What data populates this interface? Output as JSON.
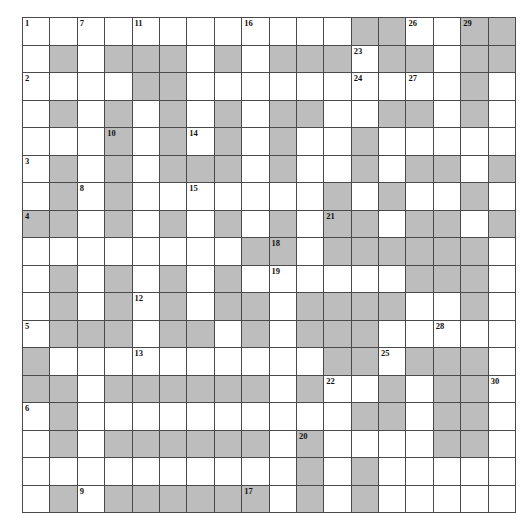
{
  "puzzle": {
    "title": "Crossword Grid",
    "columns": 18,
    "rows": 17,
    "cell_size_px": 26.4,
    "colors": {
      "background": "#ffffff",
      "open_cell": "#ffffff",
      "blocked_cell": "#bdbdbd",
      "grid_line": "#4a4a4a",
      "number_text": "#111111"
    },
    "clue_number_count": 30,
    "clue_numbers": [
      {
        "number": "1",
        "row": 1,
        "col": 1
      },
      {
        "number": "2",
        "row": 1,
        "col": 3
      },
      {
        "number": "3",
        "row": 1,
        "col": 6
      },
      {
        "number": "4",
        "row": 1,
        "col": 8
      },
      {
        "number": "5",
        "row": 1,
        "col": 12
      },
      {
        "number": "6",
        "row": 1,
        "col": 15
      },
      {
        "number": "7",
        "row": 3,
        "col": 1
      },
      {
        "number": "8",
        "row": 3,
        "col": 7
      },
      {
        "number": "9",
        "row": 3,
        "col": 18
      },
      {
        "number": "10",
        "row": 4,
        "col": 5
      },
      {
        "number": "11",
        "row": 5,
        "col": 1
      },
      {
        "number": "12",
        "row": 5,
        "col": 11
      },
      {
        "number": "13",
        "row": 5,
        "col": 13
      },
      {
        "number": "14",
        "row": 7,
        "col": 5
      },
      {
        "number": "15",
        "row": 7,
        "col": 7
      },
      {
        "number": "16",
        "row": 9,
        "col": 1
      },
      {
        "number": "17",
        "row": 9,
        "col": 18
      },
      {
        "number": "18",
        "row": 10,
        "col": 9
      },
      {
        "number": "19",
        "row": 10,
        "col": 10
      },
      {
        "number": "20",
        "row": 11,
        "col": 16
      },
      {
        "number": "21",
        "row": 12,
        "col": 8
      },
      {
        "number": "22",
        "row": 12,
        "col": 14
      },
      {
        "number": "23",
        "row": 13,
        "col": 2
      },
      {
        "number": "24",
        "row": 13,
        "col": 3
      },
      {
        "number": "25",
        "row": 14,
        "col": 13
      },
      {
        "number": "26",
        "row": 15,
        "col": 1
      },
      {
        "number": "27",
        "row": 15,
        "col": 3
      },
      {
        "number": "28",
        "row": 16,
        "col": 12
      },
      {
        "number": "29",
        "row": 17,
        "col": 1
      },
      {
        "number": "30",
        "row": 18,
        "col": 14
      }
    ],
    "grid": [
      [
        0,
        0,
        0,
        0,
        0,
        0,
        0,
        0,
        0,
        0,
        0,
        0,
        1,
        1,
        0,
        0,
        1,
        1
      ],
      [
        0,
        1,
        0,
        1,
        1,
        1,
        0,
        1,
        0,
        1,
        1,
        1,
        0,
        1,
        1,
        0,
        1,
        1
      ],
      [
        0,
        0,
        0,
        0,
        1,
        1,
        0,
        0,
        0,
        0,
        0,
        0,
        0,
        0,
        0,
        0,
        1,
        0
      ],
      [
        0,
        1,
        0,
        1,
        0,
        1,
        0,
        1,
        0,
        1,
        1,
        0,
        0,
        1,
        1,
        0,
        1,
        0
      ],
      [
        0,
        0,
        0,
        1,
        0,
        1,
        0,
        1,
        0,
        1,
        0,
        0,
        1,
        0,
        0,
        0,
        0,
        0
      ],
      [
        0,
        1,
        0,
        1,
        0,
        1,
        1,
        1,
        0,
        1,
        0,
        0,
        1,
        0,
        1,
        1,
        0,
        1
      ],
      [
        0,
        1,
        0,
        1,
        0,
        0,
        0,
        0,
        0,
        0,
        0,
        1,
        0,
        1,
        0,
        0,
        1,
        0
      ],
      [
        1,
        1,
        0,
        1,
        0,
        1,
        0,
        1,
        0,
        1,
        0,
        1,
        1,
        0,
        1,
        1,
        0,
        1
      ],
      [
        0,
        0,
        0,
        0,
        0,
        0,
        0,
        0,
        1,
        1,
        0,
        1,
        1,
        1,
        1,
        1,
        1,
        0
      ],
      [
        0,
        1,
        0,
        1,
        0,
        1,
        0,
        1,
        0,
        0,
        0,
        0,
        0,
        0,
        1,
        1,
        1,
        0
      ],
      [
        0,
        1,
        0,
        1,
        0,
        1,
        0,
        1,
        1,
        0,
        1,
        1,
        1,
        1,
        0,
        0,
        1,
        0
      ],
      [
        0,
        1,
        1,
        1,
        0,
        1,
        1,
        0,
        1,
        0,
        1,
        1,
        1,
        0,
        0,
        0,
        0,
        0
      ],
      [
        1,
        0,
        0,
        0,
        0,
        0,
        0,
        0,
        0,
        0,
        0,
        1,
        1,
        0,
        1,
        1,
        1,
        0
      ],
      [
        1,
        1,
        0,
        1,
        1,
        1,
        1,
        1,
        1,
        0,
        1,
        0,
        0,
        1,
        0,
        1,
        1,
        0
      ],
      [
        0,
        1,
        0,
        0,
        0,
        0,
        0,
        0,
        0,
        0,
        0,
        0,
        1,
        1,
        0,
        1,
        1,
        0
      ],
      [
        0,
        1,
        0,
        1,
        1,
        1,
        1,
        1,
        1,
        0,
        1,
        0,
        0,
        0,
        0,
        1,
        1,
        0
      ],
      [
        0,
        0,
        0,
        0,
        0,
        0,
        0,
        0,
        0,
        0,
        1,
        0,
        1,
        0,
        0,
        0,
        0,
        0
      ],
      [
        0,
        1,
        0,
        1,
        1,
        1,
        1,
        1,
        1,
        0,
        1,
        0,
        1,
        0,
        0,
        0,
        0,
        0
      ]
    ]
  }
}
